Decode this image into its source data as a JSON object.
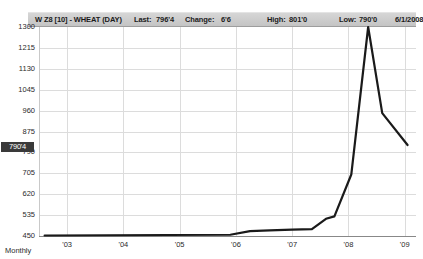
{
  "quote_bar": {
    "symbol": "W Z8 [10] - WHEAT (DAY)",
    "last_label": "Last:",
    "last_value": "796'4",
    "change_label": "Change:",
    "change_value": "6'6",
    "high_label": "High:",
    "high_value": "801'0",
    "low_label": "Low:",
    "low_value": "790'0",
    "date": "6/1/2008"
  },
  "price_badge": "790'4",
  "interval_label": "Monthly",
  "colors": {
    "line": "#1a1a1a",
    "grid": "#dcdcdc",
    "badge_bg": "#3a3a3a",
    "header_bg": "#cccccc"
  },
  "chart_data": {
    "type": "line",
    "title": "W Z8 [10] - WHEAT (DAY)",
    "xlabel": "",
    "ylabel": "",
    "grid": true,
    "legend": "none",
    "ylim": [
      450,
      1300
    ],
    "yticks": [
      1300,
      1215,
      1130,
      1045,
      960,
      875,
      790,
      705,
      620,
      535,
      450
    ],
    "ytick_labels": [
      "1300",
      "1215",
      "1130",
      "1045",
      "960",
      "875",
      "790",
      "705",
      "620",
      "535",
      "450"
    ],
    "xlim": [
      2002.5,
      2009.2
    ],
    "xticks": [
      2003,
      2004,
      2005,
      2006,
      2007,
      2008,
      2009
    ],
    "xtick_labels": [
      "'03",
      "'04",
      "'05",
      "'06",
      "'07",
      "'08",
      "'09"
    ],
    "series": [
      {
        "name": "WHEAT",
        "x": [
          2002.6,
          2005.9,
          2006.25,
          2006.6,
          2007.0,
          2007.35,
          2007.6,
          2007.75,
          2008.05,
          2008.35,
          2008.6,
          2009.05
        ],
        "y": [
          452,
          455,
          470,
          473,
          476,
          478,
          520,
          530,
          700,
          1300,
          950,
          820
        ]
      }
    ],
    "annotations": [
      {
        "label": "790'4",
        "type": "price-marker",
        "value": 790.5
      }
    ]
  }
}
